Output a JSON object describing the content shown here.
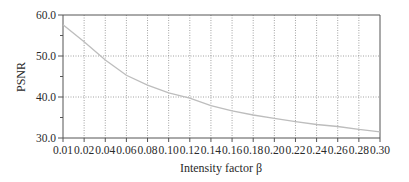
{
  "chart_data": {
    "type": "line",
    "title": "",
    "xlabel": "Intensity factor β",
    "ylabel": "PSNR",
    "categories": [
      "0.01",
      "0.02",
      "0.04",
      "0.06",
      "0.08",
      "0.10",
      "0.12",
      "0.14",
      "0.16",
      "0.18",
      "0.20",
      "0.22",
      "0.24",
      "0.26",
      "0.28",
      "0.30"
    ],
    "x": [
      0.01,
      0.02,
      0.04,
      0.06,
      0.08,
      0.1,
      0.12,
      0.14,
      0.16,
      0.18,
      0.2,
      0.22,
      0.24,
      0.26,
      0.28,
      0.3
    ],
    "series": [
      {
        "name": "PSNR",
        "values": [
          57.6,
          53.5,
          49.0,
          45.3,
          42.9,
          41.0,
          39.7,
          37.9,
          36.6,
          35.6,
          34.8,
          34.0,
          33.3,
          32.8,
          32.1,
          31.5
        ],
        "color": "#bdbdbd"
      }
    ],
    "ylim": [
      30.0,
      60.0
    ],
    "yticks": [
      "30.0",
      "40.0",
      "50.0",
      "60.0"
    ],
    "ytick_values": [
      30,
      40,
      50,
      60
    ],
    "yminor_ticks": [
      35,
      45,
      55
    ],
    "grid": true,
    "grid_style": "dotted",
    "legend": "none",
    "x_spacing": "equal (categorical)"
  },
  "colors": {
    "axis": "#555555",
    "grid": "#8a8a8a",
    "curve": "#bdbdbd",
    "text": "#2a2a2a"
  }
}
